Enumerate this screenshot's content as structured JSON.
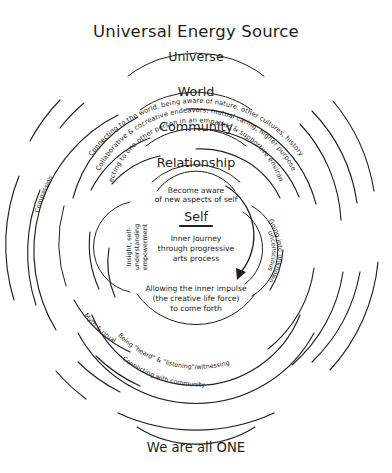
{
  "diagram": {
    "type": "concentric-circles",
    "title": "Universal Energy Source",
    "footer": "We are all ONE",
    "accent_color": "#231f20",
    "background_color": "#ffffff",
    "rings": [
      {
        "name": "universe",
        "heading": "Universe",
        "description": ""
      },
      {
        "name": "world",
        "heading": "World",
        "description": "Connecting to the world, being aware of nature, other cultures, history"
      },
      {
        "name": "community",
        "heading": "Community",
        "description": "Collaborative & cocreative endeavors, mutual caring, higher purpose"
      },
      {
        "name": "relationship",
        "heading": "Relationship",
        "description": "Connecting to one other person in an empathic & supportive environment"
      },
      {
        "name": "self",
        "heading": "Self",
        "description": ""
      }
    ],
    "center": {
      "heading": "Self",
      "body_lines": [
        "Inner Journey",
        "through progressive",
        "arts process"
      ],
      "above_lines": [
        "Become aware",
        "of new aspects of self"
      ],
      "below_lines": [
        "Allowing the inner impulse",
        "(the creative life force)",
        "to come forth"
      ],
      "left_label": "Insight, self-understanding empowerment",
      "left_label_lines": [
        "Insight, self-",
        "understanding",
        "empowerment"
      ],
      "right_label_outer": "Going into unknown",
      "right_label_inner": "unconscious"
    },
    "outward_labels": {
      "compassion": "Compassion",
      "myth_ritual": "Myth & ritual",
      "heard_listening": "Being \"heard\" & \"listening\"/witnessing",
      "connecting_community": "Connecting with community"
    },
    "icons": {
      "downward_arrow": "arrow-down-icon"
    }
  }
}
